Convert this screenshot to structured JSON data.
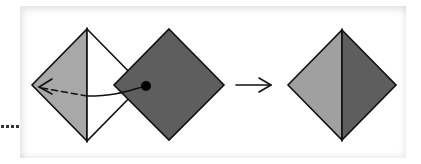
{
  "diagram": {
    "title": "",
    "colors": {
      "background": "#ffffff",
      "light_fill": "#a8a8a8",
      "dark_fill": "#5e5e5e",
      "white_fill": "#ffffff",
      "stroke": "#111111",
      "dot": "#000000"
    },
    "elements": [
      {
        "id": "left-diamond",
        "label": "Left diamond (light left half, white right half)"
      },
      {
        "id": "dark-flap",
        "label": "Dark square flap overlapping right"
      },
      {
        "id": "pivot-dot",
        "label": "Black dot on flap"
      },
      {
        "id": "fold-arrow",
        "label": "Curved fold arrow from dot to left vertex, solid then dashed"
      },
      {
        "id": "step-arrow",
        "label": "Right-pointing arrow indicating result"
      },
      {
        "id": "result-diamond",
        "label": "Result diamond (light left half, dark right half)"
      },
      {
        "id": "continuation-dots",
        "label": "Four dots at lower left"
      }
    ],
    "step_arrow_symbol": "→"
  }
}
